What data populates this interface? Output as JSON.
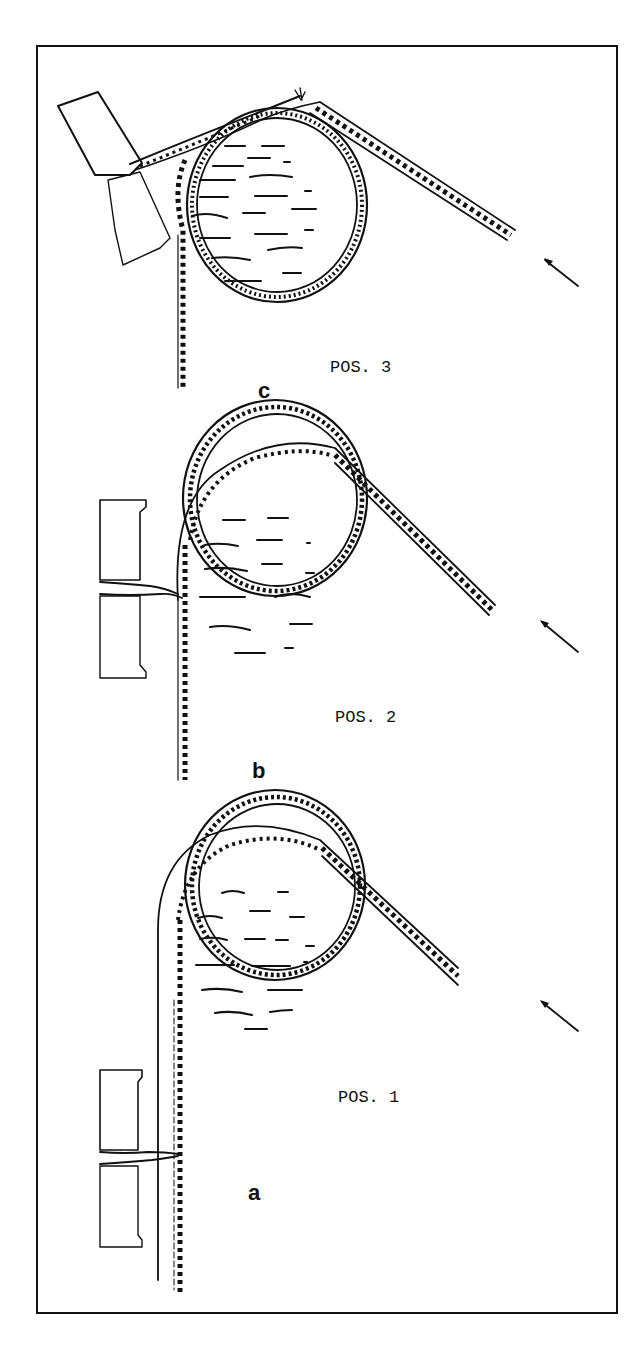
{
  "figure": {
    "frame": {
      "x": 37,
      "y": 46,
      "width": 580,
      "height": 1267,
      "stroke": "#111111"
    },
    "ink_color": "#111111",
    "background": "#ffffff",
    "panels": [
      {
        "id": "c",
        "letter": "c",
        "position_label": "POS. 3",
        "letter_xy": [
          258,
          398
        ],
        "label_xy": [
          330,
          372
        ],
        "cylinder": {
          "cx": 277,
          "cy": 205,
          "rx": 90,
          "ry": 97
        },
        "arrow": {
          "from": [
            578,
            286
          ],
          "to": [
            543,
            259
          ]
        },
        "state": "web torn at clamp"
      },
      {
        "id": "b",
        "letter": "b",
        "position_label": "POS. 2",
        "letter_xy": [
          252,
          778
        ],
        "label_xy": [
          335,
          722
        ],
        "cylinder": {
          "cx": 275,
          "cy": 498,
          "rx": 92,
          "ry": 98
        },
        "arrow": {
          "from": [
            578,
            652
          ],
          "to": [
            540,
            621
          ]
        },
        "state": "web engaged in clamp"
      },
      {
        "id": "a",
        "letter": "a",
        "position_label": "POS. 1",
        "letter_xy": [
          248,
          1200
        ],
        "label_xy": [
          338,
          1102
        ],
        "cylinder": {
          "cx": 275,
          "cy": 885,
          "rx": 90,
          "ry": 95
        },
        "arrow": {
          "from": [
            578,
            1031
          ],
          "to": [
            540,
            1000
          ]
        },
        "state": "web approaching clamp"
      }
    ]
  }
}
